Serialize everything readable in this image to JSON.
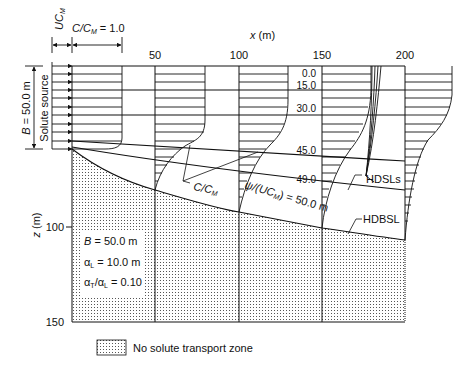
{
  "figure": {
    "type": "diagram",
    "x_axis": {
      "label": "x (m)",
      "ticks": [
        "50",
        "100",
        "150",
        "200"
      ]
    },
    "z_axis": {
      "label": "z (m)",
      "ticks": [
        "100",
        "150"
      ]
    },
    "top_labels": {
      "velocity": "UC",
      "velocity_sub": "M",
      "conc_ref": "C/C",
      "conc_ref_sub": "M",
      "conc_ref_value": " = 1.0"
    },
    "source": {
      "width_label": "B = 50.0 m",
      "name": "Solute source"
    },
    "streamline_values": [
      "0.0",
      "15.0",
      "30.0",
      "45.0",
      "49.0"
    ],
    "annotations": {
      "profile_label": "C/C",
      "profile_label_sub": "M",
      "psi_label_pre": "ψ/(UC",
      "psi_label_sub": "M",
      "psi_label_post": ") = 50.0 m",
      "hdsls": "HDSLs",
      "hdbsl": "HDBSL"
    },
    "parameters": [
      "B = 50.0 m",
      "αL = 10.0 m",
      "αT/αL = 0.10"
    ],
    "params": {
      "B": "B = 50.0 m",
      "aL_pre": "α",
      "aL_sub": "L",
      "aL_post": " = 10.0 m",
      "aT_pre": "α",
      "aT_sub": "T",
      "aT_mid": "/α",
      "aT_sub2": "L",
      "aT_post": " = 0.10"
    },
    "legend": {
      "label": "No solute transport zone"
    }
  }
}
